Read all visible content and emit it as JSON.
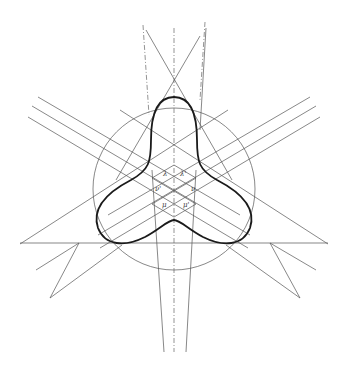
{
  "figure": {
    "colors": {
      "ink": "#444444",
      "curve": "#1a1a1a",
      "background": "#ffffff"
    },
    "center": [
      174,
      188
    ],
    "circle_radius": 81,
    "labels": [
      {
        "text": "λ",
        "x": 163,
        "y": 176
      },
      {
        "text": "λ'",
        "x": 180,
        "y": 176
      },
      {
        "text": "ν'",
        "x": 155,
        "y": 191
      },
      {
        "text": "ν",
        "x": 191,
        "y": 191
      },
      {
        "text": "μ",
        "x": 162,
        "y": 207
      },
      {
        "text": "μ'",
        "x": 183,
        "y": 207
      }
    ]
  }
}
